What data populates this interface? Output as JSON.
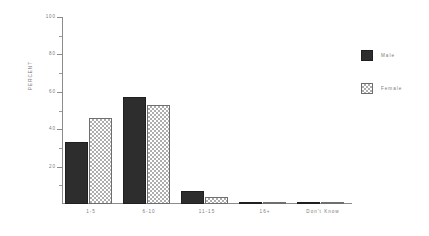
{
  "chart_data": {
    "type": "bar",
    "title": "",
    "subtitle": "",
    "xlabel": "",
    "ylabel": "PERCENT",
    "ylim": [
      0,
      100
    ],
    "ytick_labels": [
      "100",
      "80",
      "60",
      "40",
      "20"
    ],
    "ytick_values": [
      100,
      80,
      60,
      40,
      20
    ],
    "yminor_values": [
      90,
      70,
      50,
      30,
      10
    ],
    "grid": false,
    "legend_position": "right",
    "categories": [
      "1-5",
      "6-10",
      "11-15",
      "16+",
      "Don't Know"
    ],
    "series": [
      {
        "name": "Male",
        "color": "#2d2d2d",
        "pattern": "solid",
        "values": [
          33,
          57,
          7,
          1,
          0.4
        ]
      },
      {
        "name": "Female",
        "color": "#777777",
        "pattern": "checkerboard",
        "values": [
          46,
          53,
          4,
          0.3,
          0.3
        ]
      }
    ]
  },
  "legend": {
    "items": [
      {
        "label": "Male"
      },
      {
        "label": "Female"
      }
    ]
  },
  "axes": {
    "y_title": "PERCENT"
  }
}
